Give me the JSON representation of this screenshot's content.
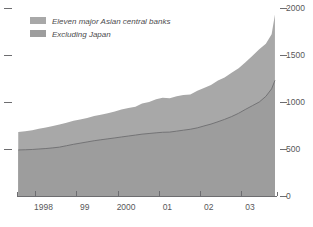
{
  "chart_data": {
    "type": "area",
    "title": "",
    "subtitle": "",
    "xlabel": "",
    "ylabel": "",
    "stacked": false,
    "grid": false,
    "legend_position": "top-left",
    "ylim": [
      0,
      2000
    ],
    "y_ticks": [
      0,
      500,
      1000,
      1500,
      2000
    ],
    "y_tick_labels": [
      "0",
      "500",
      "1000",
      "1500",
      "2000"
    ],
    "y_axis_side": "right",
    "left_axis_ticks_unlabeled": [
      500,
      1000,
      1500,
      2000
    ],
    "x_tick_labels": [
      "1998",
      "99",
      "2000",
      "01",
      "02",
      "03"
    ],
    "x_tick_positions": [
      1998.0,
      1999.0,
      2000.0,
      2001.0,
      2002.0,
      2003.0
    ],
    "xlim": [
      1997.55,
      2003.85
    ],
    "colors": {
      "series_total_fill": "#a8a8a8",
      "series_ex_japan_fill": "#9d9d9d",
      "divider_line": "#6e6e70",
      "axis": "#6d6d70",
      "text": "#58585a",
      "background": "#ffffff"
    },
    "series": [
      {
        "name": "Eleven major Asian central banks",
        "swatch_color": "#a8a8a8",
        "x": [
          1997.58,
          1997.75,
          1997.92,
          1998.08,
          1998.25,
          1998.42,
          1998.58,
          1998.75,
          1998.92,
          1999.08,
          1999.25,
          1999.42,
          1999.58,
          1999.75,
          1999.92,
          2000.08,
          2000.25,
          2000.42,
          2000.58,
          2000.75,
          2000.92,
          2001.08,
          2001.25,
          2001.42,
          2001.58,
          2001.75,
          2001.92,
          2002.08,
          2002.25,
          2002.42,
          2002.58,
          2002.75,
          2002.92,
          2003.08,
          2003.25,
          2003.42,
          2003.58,
          2003.72,
          2003.8
        ],
        "values": [
          680,
          690,
          700,
          715,
          730,
          745,
          760,
          780,
          800,
          815,
          830,
          850,
          865,
          880,
          900,
          920,
          935,
          950,
          985,
          1000,
          1030,
          1045,
          1040,
          1060,
          1075,
          1080,
          1120,
          1150,
          1180,
          1230,
          1260,
          1310,
          1360,
          1420,
          1490,
          1560,
          1620,
          1720,
          1930
        ]
      },
      {
        "name": "Excluding Japan",
        "swatch_color": "#9d9d9d",
        "x": [
          1997.58,
          1997.75,
          1997.92,
          1998.08,
          1998.25,
          1998.42,
          1998.58,
          1998.75,
          1998.92,
          1999.08,
          1999.25,
          1999.42,
          1999.58,
          1999.75,
          1999.92,
          2000.08,
          2000.25,
          2000.42,
          2000.58,
          2000.75,
          2000.92,
          2001.08,
          2001.25,
          2001.42,
          2001.58,
          2001.75,
          2001.92,
          2002.08,
          2002.25,
          2002.42,
          2002.58,
          2002.75,
          2002.92,
          2003.08,
          2003.25,
          2003.42,
          2003.58,
          2003.72,
          2003.8
        ],
        "values": [
          490,
          492,
          495,
          500,
          505,
          512,
          520,
          535,
          550,
          562,
          575,
          588,
          598,
          608,
          618,
          628,
          638,
          648,
          658,
          665,
          672,
          678,
          680,
          690,
          700,
          710,
          725,
          745,
          765,
          790,
          815,
          845,
          880,
          920,
          960,
          1000,
          1060,
          1140,
          1230
        ]
      }
    ]
  },
  "legend": {
    "items": [
      {
        "label": "Eleven major Asian central banks",
        "color": "#a8a8a8"
      },
      {
        "label": "Excluding Japan",
        "color": "#9d9d9d"
      }
    ]
  },
  "axes": {
    "right_labels": [
      "2000",
      "1500",
      "1000",
      "500",
      "0"
    ],
    "bottom_labels": [
      "1998",
      "99",
      "2000",
      "01",
      "02",
      "03"
    ]
  }
}
